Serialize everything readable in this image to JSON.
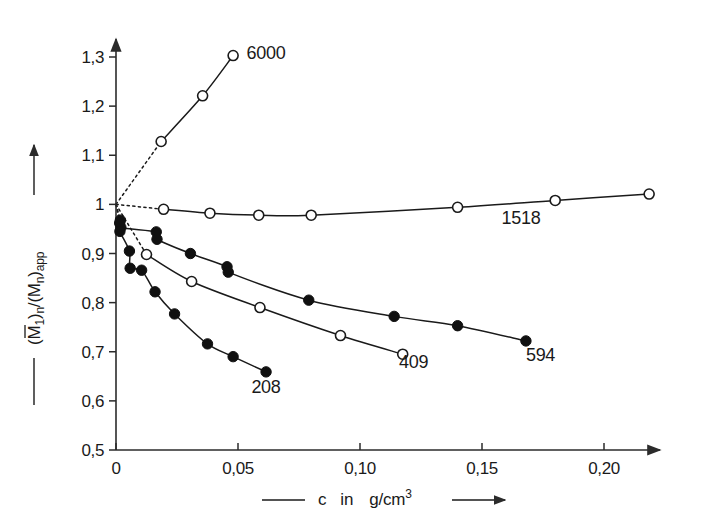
{
  "chart_data": {
    "type": "line",
    "title": "",
    "subtitle": "",
    "xlabel": "c  in  g/cm3",
    "xlabel_parts": {
      "var": "c",
      "in": "in",
      "unit_base": "g/cm",
      "unit_exp": "3"
    },
    "ylabel": "(M1)n /(Mn)app",
    "ylabel_parts": {
      "open1": "(",
      "m1": "M",
      "m1_sub": "1",
      "close1": ")",
      "close1_sub": "n",
      "slash": "/(",
      "m2": "M",
      "m2_sub": "n",
      "close2": ")",
      "close2_sub": "app"
    },
    "xlim": [
      0,
      0.235
    ],
    "ylim": [
      0.5,
      1.33
    ],
    "xticks": [
      0,
      0.05,
      0.1,
      0.15,
      0.2
    ],
    "xticklabels": [
      "0",
      "0,05",
      "0,10",
      "0,15",
      "0,20"
    ],
    "yticks": [
      0.5,
      0.6,
      0.7,
      0.8,
      0.9,
      1.0,
      1.1,
      1.2,
      1.3
    ],
    "yticklabels": [
      "0,5",
      "0,6",
      "0,7",
      "0,8",
      "0,9",
      "1",
      "1,1",
      "1,2",
      "1,3"
    ],
    "grid": false,
    "legend_position": "inline-annotations",
    "intercept": {
      "x": 0,
      "y": 1.0
    },
    "series": [
      {
        "name": "6000",
        "label": "6000",
        "marker": "open-circle",
        "label_x": 0.0535,
        "label_y": 1.295,
        "dotted_from": [
          0.0,
          1.0
        ],
        "points": [
          {
            "x": 0.0185,
            "y": 1.128
          },
          {
            "x": 0.0355,
            "y": 1.221
          },
          {
            "x": 0.048,
            "y": 1.303
          }
        ]
      },
      {
        "name": "1518",
        "label": "1518",
        "marker": "open-circle",
        "label_x": 0.158,
        "label_y": 0.96,
        "dotted_from": [
          0.0,
          1.0
        ],
        "points": [
          {
            "x": 0.0195,
            "y": 0.99
          },
          {
            "x": 0.0385,
            "y": 0.982
          },
          {
            "x": 0.0585,
            "y": 0.978
          },
          {
            "x": 0.08,
            "y": 0.978
          },
          {
            "x": 0.14,
            "y": 0.994
          },
          {
            "x": 0.18,
            "y": 1.008
          },
          {
            "x": 0.2185,
            "y": 1.021
          }
        ]
      },
      {
        "name": "594",
        "label": "594",
        "marker": "filled-circle",
        "label_x": 0.168,
        "label_y": 0.682,
        "dotted_from": [
          0.0,
          1.0
        ],
        "points": [
          {
            "x": 0.0018,
            "y": 0.968
          },
          {
            "x": 0.002,
            "y": 0.953
          },
          {
            "x": 0.0165,
            "y": 0.944
          },
          {
            "x": 0.0168,
            "y": 0.929
          },
          {
            "x": 0.0305,
            "y": 0.9
          },
          {
            "x": 0.0455,
            "y": 0.873
          },
          {
            "x": 0.046,
            "y": 0.862
          },
          {
            "x": 0.079,
            "y": 0.805
          },
          {
            "x": 0.114,
            "y": 0.772
          },
          {
            "x": 0.14,
            "y": 0.753
          },
          {
            "x": 0.168,
            "y": 0.722
          }
        ]
      },
      {
        "name": "409",
        "label": "409",
        "marker": "open-circle",
        "label_x": 0.116,
        "label_y": 0.666,
        "dotted_from": [
          0.0,
          1.0
        ],
        "points": [
          {
            "x": 0.0125,
            "y": 0.898
          },
          {
            "x": 0.031,
            "y": 0.843
          },
          {
            "x": 0.059,
            "y": 0.79
          },
          {
            "x": 0.092,
            "y": 0.733
          },
          {
            "x": 0.1175,
            "y": 0.695
          }
        ]
      },
      {
        "name": "208",
        "label": "208",
        "marker": "filled-circle",
        "label_x": 0.0555,
        "label_y": 0.617,
        "dotted_from": [
          0.0,
          1.0
        ],
        "points": [
          {
            "x": 0.0015,
            "y": 0.962
          },
          {
            "x": 0.0016,
            "y": 0.945
          },
          {
            "x": 0.0055,
            "y": 0.905
          },
          {
            "x": 0.0058,
            "y": 0.87
          },
          {
            "x": 0.0105,
            "y": 0.866
          },
          {
            "x": 0.016,
            "y": 0.822
          },
          {
            "x": 0.024,
            "y": 0.777
          },
          {
            "x": 0.0375,
            "y": 0.716
          },
          {
            "x": 0.048,
            "y": 0.69
          },
          {
            "x": 0.0615,
            "y": 0.659
          }
        ]
      }
    ]
  }
}
